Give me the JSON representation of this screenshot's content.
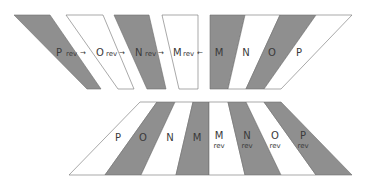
{
  "colors": {
    "gray": "#8f8f8f",
    "white": "#ffffff",
    "stroke": "#6e6e6e"
  },
  "top_row": {
    "pieces": [
      {
        "letter": "P",
        "suffix": "rev",
        "fill": "gray",
        "points": "14,15 50,15 101,89 87,89",
        "lx": 56,
        "ly": 56
      },
      {
        "letter": "O",
        "suffix": "rev",
        "fill": "white",
        "points": "66,15 103,15 134,89 118,89",
        "lx": 96,
        "ly": 56
      },
      {
        "letter": "N",
        "suffix": "rev",
        "fill": "gray",
        "points": "114,15 149,15 166,89 147,89",
        "lx": 135,
        "ly": 56
      },
      {
        "letter": "M",
        "suffix": "rev",
        "fill": "white",
        "points": "162,15 198,15 198,89 179,89",
        "lx": 173,
        "ly": 56
      }
    ],
    "arrows": [
      {
        "glyph": "→",
        "x": 83,
        "y": 55
      },
      {
        "glyph": "→",
        "x": 122,
        "y": 55
      },
      {
        "glyph": "→",
        "x": 161,
        "y": 55
      },
      {
        "glyph": "←",
        "x": 200,
        "y": 55
      }
    ],
    "block": [
      {
        "letter": "M",
        "fill": "gray",
        "points": "210,15 245,15 228,89 210,89",
        "lx": 219,
        "ly": 56
      },
      {
        "letter": "N",
        "fill": "white",
        "points": "245,15 280,15 246,89 228,89",
        "lx": 246,
        "ly": 56
      },
      {
        "letter": "O",
        "fill": "gray",
        "points": "280,15 316,15 264,89 246,89",
        "lx": 272,
        "ly": 56
      },
      {
        "letter": "P",
        "fill": "white",
        "points": "316,15 352,15 281,89 264,89",
        "lx": 299,
        "ly": 56
      }
    ]
  },
  "bottom_row": {
    "pieces": [
      {
        "letter": "P",
        "suffix": "",
        "fill": "white",
        "points": "140,102 157,102 105,175 69,175",
        "lx": 118,
        "ly": 141
      },
      {
        "letter": "O",
        "suffix": "",
        "fill": "gray",
        "points": "157,102 175,102 141,175 105,175",
        "lx": 143,
        "ly": 141
      },
      {
        "letter": "N",
        "suffix": "",
        "fill": "white",
        "points": "175,102 193,102 176,175 141,175",
        "lx": 170,
        "ly": 141
      },
      {
        "letter": "M",
        "suffix": "",
        "fill": "gray",
        "points": "193,102 209,102 209,175 176,175",
        "lx": 197,
        "ly": 141
      },
      {
        "letter": "M",
        "suffix": "rev",
        "fill": "white",
        "points": "209,102 228,102 245,175 209,175",
        "lx": 219,
        "ly": 139
      },
      {
        "letter": "N",
        "suffix": "rev",
        "fill": "gray",
        "points": "228,102 246,102 281,175 245,175",
        "lx": 247,
        "ly": 139
      },
      {
        "letter": "O",
        "suffix": "rev",
        "fill": "white",
        "points": "246,102 264,102 316,175 281,175",
        "lx": 275,
        "ly": 139
      },
      {
        "letter": "P",
        "suffix": "rev",
        "fill": "gray",
        "points": "264,102 281,102 352,175 316,175",
        "lx": 303,
        "ly": 139
      }
    ]
  }
}
